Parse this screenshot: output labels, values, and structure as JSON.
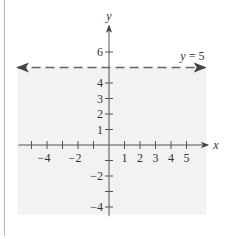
{
  "chart_data": {
    "type": "line",
    "title": "",
    "xlabel": "x",
    "ylabel": "y",
    "xlim": [
      -5.5,
      6.4
    ],
    "ylim": [
      -4.5,
      7.6
    ],
    "x_ticks": [
      -5,
      -4,
      -3,
      -2,
      -1,
      1,
      2,
      3,
      4,
      5
    ],
    "x_tick_labels": [
      {
        "value": -4,
        "label": "−4"
      },
      {
        "value": -2,
        "label": "−2"
      },
      {
        "value": 1,
        "label": "1"
      },
      {
        "value": 2,
        "label": "2"
      },
      {
        "value": 3,
        "label": "3"
      },
      {
        "value": 4,
        "label": "4"
      },
      {
        "value": 5,
        "label": "5"
      }
    ],
    "y_ticks": [
      -4,
      -3,
      -2,
      -1,
      1,
      2,
      3,
      4,
      6
    ],
    "y_tick_labels": [
      {
        "value": 6,
        "label": "6"
      },
      {
        "value": 4,
        "label": "4"
      },
      {
        "value": 3,
        "label": "3"
      },
      {
        "value": 2,
        "label": "2"
      },
      {
        "value": 1,
        "label": "1"
      },
      {
        "value": -2,
        "label": "−2"
      },
      {
        "value": -4,
        "label": "−4"
      }
    ],
    "series": [
      {
        "name": "y = 5",
        "kind": "boundary-line",
        "style": "dashed",
        "equation": "y = 5",
        "x": [
          -5.9,
          6.2
        ],
        "y": [
          5,
          5
        ],
        "arrows": "both"
      }
    ],
    "shaded_region": {
      "description": "Half-plane below the line y = 5 (y < 5)",
      "x_range": [
        -5.9,
        6.3
      ],
      "y_range": [
        -4.5,
        5
      ],
      "color": "#f2f2f2"
    },
    "annotations": [
      {
        "text": "y = 5",
        "x": 4.6,
        "y": 5.5
      }
    ],
    "grid": false,
    "legend": null
  },
  "labels": {
    "x_axis": "x",
    "y_axis": "y",
    "equation_var": "y",
    "equation_rest": " = 5"
  },
  "colors": {
    "axis": "#555555",
    "dashed_line": "#666666",
    "shade": "#f2f2f2",
    "border": "#b8b8b8",
    "text": "#333333"
  }
}
